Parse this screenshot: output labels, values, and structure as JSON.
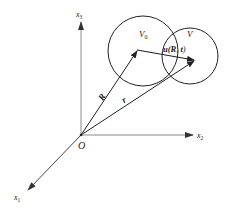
{
  "diagram": {
    "type": "vector-displacement-3d",
    "origin": {
      "label": "O"
    },
    "axes": [
      {
        "id": "x1",
        "base": "x",
        "sub": "1"
      },
      {
        "id": "x2",
        "base": "x",
        "sub": "2"
      },
      {
        "id": "x3",
        "base": "x",
        "sub": "3"
      }
    ],
    "regions": [
      {
        "id": "V0",
        "base": "V",
        "sub": "0"
      },
      {
        "id": "V",
        "base": "V",
        "sub": ""
      }
    ],
    "vectors": [
      {
        "id": "R",
        "label": "R"
      },
      {
        "id": "r",
        "label": "r"
      },
      {
        "id": "u",
        "label": "u(R,  t)",
        "parts": {
          "fn": "u(",
          "arg1": "R",
          "sep": ",  ",
          "arg2": "t",
          "close": ")"
        }
      }
    ],
    "colors": {
      "axis": "#8a8a8a",
      "line": "#222222",
      "background": "#ffffff"
    }
  }
}
